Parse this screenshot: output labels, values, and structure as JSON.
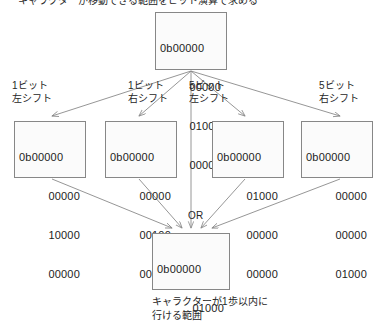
{
  "diagram": {
    "title": "キャラクターが移動できる範囲をビット演算で求める",
    "or_label": "OR",
    "caption_line1": "キャラクターが1歩以内に",
    "caption_line2": "行ける範囲",
    "source": {
      "lines": [
        "0b00000",
        "00000",
        "01000",
        "00000"
      ]
    },
    "shifts": [
      {
        "label_line1": "1ビット",
        "label_line2": "左シフト",
        "lines": [
          "0b00000",
          "00000",
          "10000",
          "00000"
        ]
      },
      {
        "label_line1": "1ビット",
        "label_line2": "右シフト",
        "lines": [
          "0b00000",
          "00000",
          "00100",
          "00000"
        ]
      },
      {
        "label_line1": "5ビット",
        "label_line2": "左シフト",
        "lines": [
          "0b00000",
          "01000",
          "00000",
          "00000"
        ]
      },
      {
        "label_line1": "5ビット",
        "label_line2": "右シフト",
        "lines": [
          "0b00000",
          "00000",
          "00000",
          "01000"
        ]
      }
    ],
    "result": {
      "lines": [
        "0b00000",
        "01000",
        "11100",
        "01000"
      ]
    },
    "colors": {
      "box_border": "#878787",
      "box_fill": "#fbfbfb",
      "edge": "#8a8a8a",
      "text": "#1d1d1d"
    }
  }
}
